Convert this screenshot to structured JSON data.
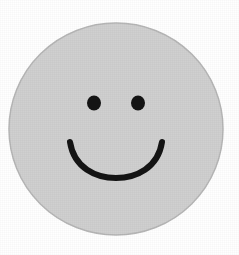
{
  "image": {
    "subject": "smiley-face",
    "description": "Hand-drawn style smiley face: light gray filled circle with two black dot eyes and a black curved smile",
    "background_color": "#ffffff",
    "width": 239,
    "height": 255
  },
  "face": {
    "name": "face-circle",
    "fill_color": "#d0d0d0",
    "stroke_color": "#b6b6b6",
    "stroke_width": 1.5,
    "center_x": 116,
    "center_y": 129,
    "radius_x": 107,
    "radius_y": 106
  },
  "eyes": {
    "color": "#141414",
    "left": {
      "name": "left-eye",
      "center_x": 94,
      "center_y": 103,
      "radius_x": 7,
      "radius_y": 7.5
    },
    "right": {
      "name": "right-eye",
      "center_x": 138,
      "center_y": 103,
      "radius_x": 7,
      "radius_y": 7.5
    }
  },
  "mouth": {
    "name": "smile-mouth",
    "color": "#141414",
    "stroke_width": 6,
    "start_x": 70,
    "start_y": 142,
    "end_x": 162,
    "end_y": 142,
    "bottom_y": 172,
    "path": "M 70 142 C 74 168, 96 178, 116 178 C 136 178, 158 168, 162 142"
  }
}
